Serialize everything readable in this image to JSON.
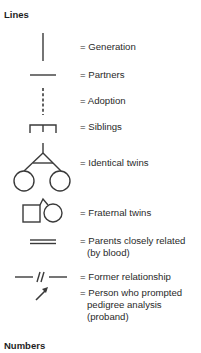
{
  "sections": {
    "lines_title": "Lines",
    "numbers_title": "Numbers"
  },
  "legend": [
    {
      "symbol": "generation-line",
      "label": "= Generation"
    },
    {
      "symbol": "partners-line",
      "label": "= Partners"
    },
    {
      "symbol": "adoption-dashed-line",
      "label": "= Adoption"
    },
    {
      "symbol": "siblings-bracket",
      "label": "= Siblings"
    },
    {
      "symbol": "identical-twins",
      "label": "= Identical twins"
    },
    {
      "symbol": "fraternal-twins",
      "label": "= Fraternal twins"
    },
    {
      "symbol": "double-line",
      "label": "= Parents closely related",
      "label_cont": "(by blood)"
    },
    {
      "symbol": "broken-line",
      "label": "= Former relationship"
    },
    {
      "symbol": "proband-arrow",
      "label": "= Person who prompted",
      "label_cont": "pedigree analysis",
      "label_cont2": "(proband)"
    }
  ],
  "colors": {
    "stroke": "#3a3a3a",
    "text": "#2a2a2a"
  }
}
